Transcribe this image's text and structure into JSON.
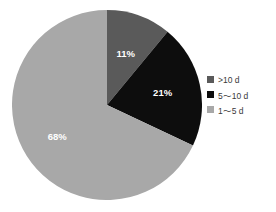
{
  "chart_data": {
    "type": "pie",
    "title": "",
    "categories": [
      ">10 d",
      "5～10 d",
      "1～5 d"
    ],
    "values": [
      11,
      21,
      68
    ],
    "labels": [
      "11%",
      "21%",
      "68%"
    ],
    "colors": [
      "#5a5a5a",
      "#0d0d0d",
      "#a8a8a8"
    ],
    "legend_position": "right",
    "start_angle_deg": 0,
    "direction": "clockwise",
    "grid": false,
    "background": "#ffffff",
    "label_color": "#ffffff",
    "legend_text_color": "#3a3a3a",
    "series": [
      {
        "name": ">10 d",
        "value": 11,
        "label": "11%",
        "color": "#5a5a5a"
      },
      {
        "name": "5～10 d",
        "value": 21,
        "label": "21%",
        "color": "#0d0d0d"
      },
      {
        "name": "1～5 d",
        "value": 68,
        "label": "68%",
        "color": "#a8a8a8"
      }
    ]
  },
  "legend": {
    "items": [
      {
        "label": ">10 d",
        "color": "#5a5a5a"
      },
      {
        "label": "5～10 d",
        "color": "#0d0d0d"
      },
      {
        "label": "1～5 d",
        "color": "#a8a8a8"
      }
    ]
  }
}
